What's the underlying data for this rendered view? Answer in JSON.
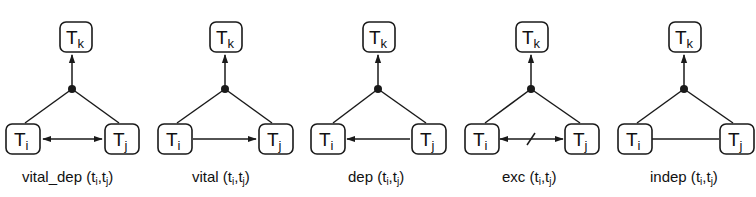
{
  "figure": {
    "diagrams": [
      {
        "relation": "vital_dep",
        "caption_prefix": "vital_dep (",
        "caption_args": [
          "t",
          "i",
          ",",
          "t",
          "j",
          ")"
        ],
        "edge_type": "bidirectional",
        "nodes": {
          "top": {
            "main": "T",
            "sub": "k"
          },
          "left": {
            "main": "T",
            "sub": "i"
          },
          "right": {
            "main": "T",
            "sub": "j"
          }
        }
      },
      {
        "relation": "vital",
        "caption_prefix": "vital (",
        "caption_args": [
          "t",
          "i",
          ",",
          "t",
          "j",
          ")"
        ],
        "edge_type": "left-to-right",
        "nodes": {
          "top": {
            "main": "T",
            "sub": "k"
          },
          "left": {
            "main": "T",
            "sub": "i"
          },
          "right": {
            "main": "T",
            "sub": "j"
          }
        }
      },
      {
        "relation": "dep",
        "caption_prefix": "dep (",
        "caption_args": [
          "t",
          "i",
          ",",
          "t",
          "j",
          ")"
        ],
        "edge_type": "right-to-left",
        "nodes": {
          "top": {
            "main": "T",
            "sub": "k"
          },
          "left": {
            "main": "T",
            "sub": "i"
          },
          "right": {
            "main": "T",
            "sub": "j"
          }
        }
      },
      {
        "relation": "exc",
        "caption_prefix": "exc (",
        "caption_args": [
          "t",
          "i",
          ",",
          "t",
          "j",
          ")"
        ],
        "edge_type": "bidirectional-crossed",
        "nodes": {
          "top": {
            "main": "T",
            "sub": "k"
          },
          "left": {
            "main": "T",
            "sub": "i"
          },
          "right": {
            "main": "T",
            "sub": "j"
          }
        }
      },
      {
        "relation": "indep",
        "caption_prefix": "indep (",
        "caption_args": [
          "t",
          "i",
          ",",
          "t",
          "j",
          ")"
        ],
        "edge_type": "undirected",
        "nodes": {
          "top": {
            "main": "T",
            "sub": "k"
          },
          "left": {
            "main": "T",
            "sub": "i"
          },
          "right": {
            "main": "T",
            "sub": "j"
          }
        }
      }
    ],
    "colors": {
      "stroke": "#1a1a1a",
      "background": "#ffffff"
    }
  }
}
